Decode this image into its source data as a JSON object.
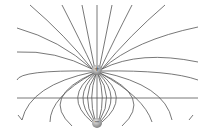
{
  "diagram": {
    "charges": [
      {
        "sign": "+",
        "x": 97,
        "y": 70
      },
      {
        "sign": "−",
        "x": 97,
        "y": 123
      }
    ],
    "line_color": "#555555",
    "charge_color": "#9a9a9a",
    "horizontal_line_y": 98
  }
}
